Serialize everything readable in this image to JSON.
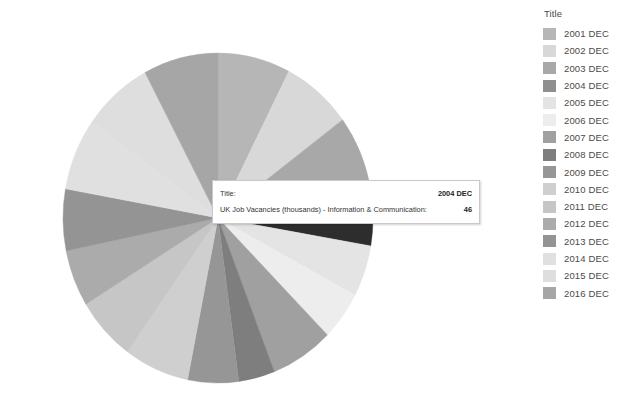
{
  "legend": {
    "title": "Title",
    "items": [
      {
        "label": "2001 DEC",
        "color": "#b6b6b6"
      },
      {
        "label": "2002 DEC",
        "color": "#d8d8d8"
      },
      {
        "label": "2003 DEC",
        "color": "#a8a8a8"
      },
      {
        "label": "2004 DEC",
        "color": "#8f8f8f"
      },
      {
        "label": "2005 DEC",
        "color": "#e4e4e4"
      },
      {
        "label": "2006 DEC",
        "color": "#ededed"
      },
      {
        "label": "2007 DEC",
        "color": "#a0a0a0"
      },
      {
        "label": "2008 DEC",
        "color": "#7e7e7e"
      },
      {
        "label": "2009 DEC",
        "color": "#969696"
      },
      {
        "label": "2010 DEC",
        "color": "#cfcfcf"
      },
      {
        "label": "2011 DEC",
        "color": "#c6c6c6"
      },
      {
        "label": "2012 DEC",
        "color": "#ababab"
      },
      {
        "label": "2013 DEC",
        "color": "#949494"
      },
      {
        "label": "2014 DEC",
        "color": "#e0e0e0"
      },
      {
        "label": "2015 DEC",
        "color": "#dedede"
      },
      {
        "label": "2016 DEC",
        "color": "#a6a6a6"
      }
    ]
  },
  "tooltip": {
    "row1_key": "Title:",
    "row1_value": "2004 DEC",
    "row2_key": "UK Job Vacancies (thousands) - Information & Communication:",
    "row2_value": "46"
  },
  "chart_data": {
    "type": "pie",
    "title": "",
    "measure": "UK Job Vacancies (thousands) - Information & Communication",
    "legend_title": "Title",
    "legend_position": "right",
    "highlighted_slice": "2004 DEC",
    "highlight_color": "#2d2d2d",
    "categories": [
      "2001 DEC",
      "2002 DEC",
      "2003 DEC",
      "2004 DEC",
      "2005 DEC",
      "2006 DEC",
      "2007 DEC",
      "2008 DEC",
      "2009 DEC",
      "2010 DEC",
      "2011 DEC",
      "2012 DEC",
      "2013 DEC",
      "2014 DEC",
      "2015 DEC",
      "2016 DEC"
    ],
    "values": [
      60,
      58,
      56,
      46,
      40,
      38,
      52,
      30,
      42,
      54,
      50,
      44,
      48,
      56,
      58,
      62
    ],
    "colors": [
      "#b6b6b6",
      "#d8d8d8",
      "#a8a8a8",
      "#2d2d2d",
      "#e4e4e4",
      "#ededed",
      "#a0a0a0",
      "#7e7e7e",
      "#969696",
      "#cfcfcf",
      "#c6c6c6",
      "#ababab",
      "#949494",
      "#e0e0e0",
      "#dedede",
      "#a6a6a6"
    ],
    "start_angle_deg": 0,
    "direction": "clockwise",
    "center_px": [
      218,
      218
    ],
    "radius_px": [
      155,
      165
    ]
  }
}
